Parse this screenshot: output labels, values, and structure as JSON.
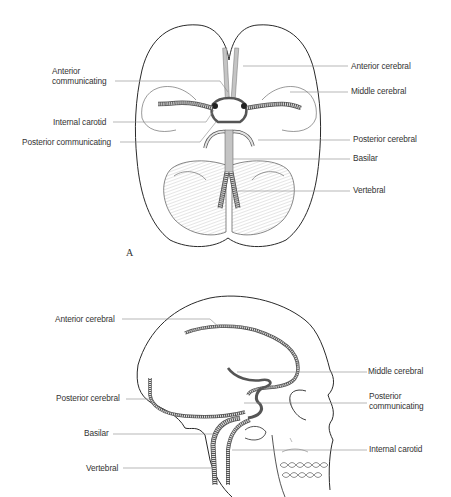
{
  "figure": {
    "panel_a": {
      "panel_label": "A",
      "title": "Inferior view of brain showing circle of Willis",
      "labels_left": {
        "anterior_communicating_1": "Anterior",
        "anterior_communicating_2": "communicating",
        "internal_carotid": "Internal carotid",
        "posterior_communicating": "Posterior communicating"
      },
      "labels_right": {
        "anterior_cerebral": "Anterior cerebral",
        "middle_cerebral": "Middle cerebral",
        "posterior_cerebral": "Posterior cerebral",
        "basilar": "Basilar",
        "vertebral": "Vertebral"
      }
    },
    "panel_b": {
      "title": "Lateral view of skull showing cerebral arteries",
      "labels_left": {
        "anterior_cerebral": "Anterior cerebral",
        "posterior_cerebral": "Posterior cerebral",
        "basilar": "Basilar",
        "vertebral": "Vertebral"
      },
      "labels_right": {
        "middle_cerebral": "Middle cerebral",
        "posterior_communicating_1": "Posterior",
        "posterior_communicating_2": "communicating",
        "internal_carotid": "Internal carotid"
      }
    },
    "colors": {
      "outline": "#2a2a2a",
      "leader": "#888888",
      "vessel_fill": "#d8d8d8",
      "vessel_stroke": "#555555",
      "text": "#333333"
    }
  }
}
